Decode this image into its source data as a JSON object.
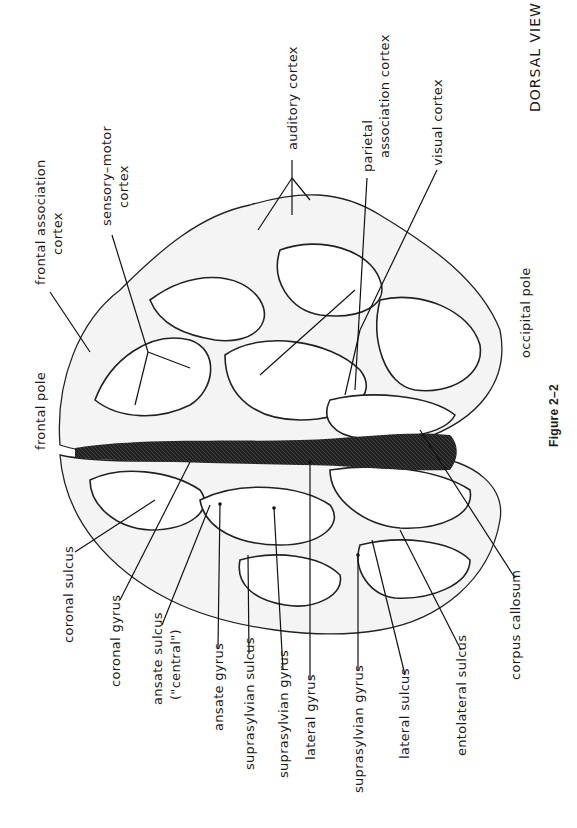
{
  "figure": {
    "header_fragment": "",
    "view_label": "DORSAL VIEW",
    "caption": "Figure 2–2",
    "orientation": "rotated 90deg counter-clockwise (text reads bottom-to-top)"
  },
  "labels": {
    "top": [
      {
        "id": "frontal-pole",
        "text": "frontal pole"
      },
      {
        "id": "frontal-association-cortex",
        "line1": "frontal association",
        "line2": "cortex"
      },
      {
        "id": "sensory-motor-cortex",
        "line1": "sensory–motor",
        "line2": "cortex"
      },
      {
        "id": "auditory-cortex",
        "text": "auditory cortex"
      },
      {
        "id": "parietal-association-cortex",
        "line1": "parietal",
        "line2": "association cortex"
      },
      {
        "id": "visual-cortex",
        "text": "visual cortex"
      },
      {
        "id": "occipital-pole",
        "text": "occipital pole"
      }
    ],
    "bottom": [
      {
        "id": "coronal-sulcus",
        "text": "coronal sulcus"
      },
      {
        "id": "coronal-gyrus",
        "text": "coronal gyrus"
      },
      {
        "id": "ansate-sulcus",
        "line1": "ansate sulcus",
        "line2": "(\"central\")"
      },
      {
        "id": "ansate-gyrus",
        "text": "ansate gyrus"
      },
      {
        "id": "suprasylvian-sulcus",
        "text": "suprasylvian sulcus"
      },
      {
        "id": "suprasylvian-gyrus-1",
        "text": "suprasylvian gyrus"
      },
      {
        "id": "lateral-gyrus",
        "text": "lateral gyrus"
      },
      {
        "id": "suprasylvian-gyrus-2",
        "text": "suprasylvian gyrus"
      },
      {
        "id": "lateral-sulcus",
        "text": "lateral sulcus"
      },
      {
        "id": "entolateral-sulcus",
        "text": "entolateral sulcus"
      },
      {
        "id": "corpus-callosum",
        "text": "corpus callosum"
      }
    ]
  },
  "colors": {
    "ink": "#111111",
    "paper": "#ffffff"
  }
}
